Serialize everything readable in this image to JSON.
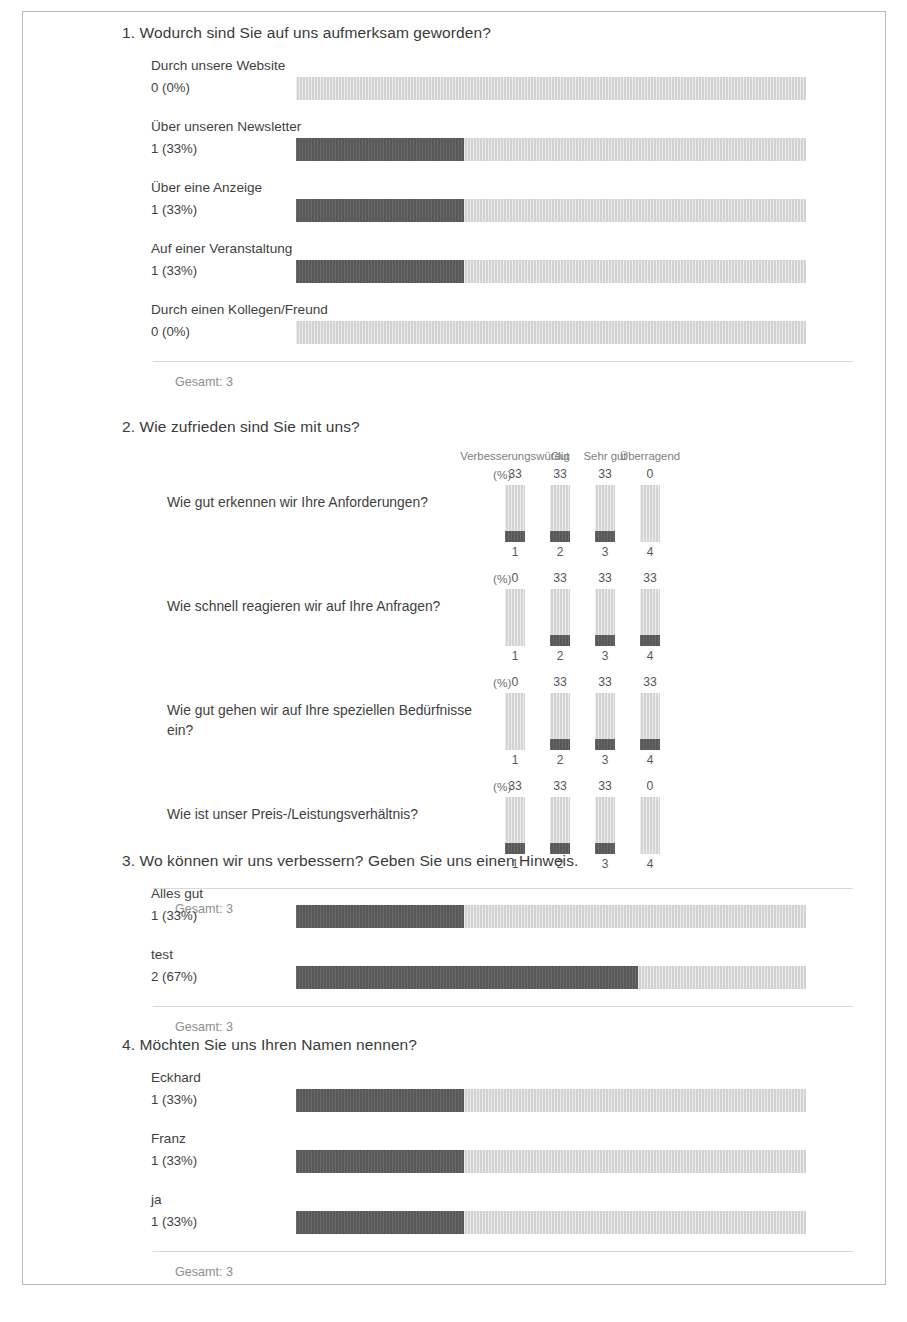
{
  "colors": {
    "bar_fill": "#585858",
    "bar_track": "#d2d2d2",
    "frame_border": "#b9b9b9",
    "text": "#3f3f3f",
    "muted_text": "#8e8e8e"
  },
  "labels": {
    "gesamt_prefix": "Gesamt:",
    "percent_axis_label": "(%)"
  },
  "questions": [
    {
      "id": "q1",
      "number": "1.",
      "title": "1. Wodurch sind Sie auf uns aufmerksam geworden?",
      "type": "bar",
      "total_label": "Gesamt: 3",
      "total": 3,
      "options": [
        {
          "label": "Durch unsere Website",
          "count": 0,
          "percent": 0,
          "value_label": "0 (0%)"
        },
        {
          "label": "Über unseren Newsletter",
          "count": 1,
          "percent": 33,
          "value_label": "1 (33%)"
        },
        {
          "label": "Über eine Anzeige",
          "count": 1,
          "percent": 33,
          "value_label": "1 (33%)"
        },
        {
          "label": "Auf einer Veranstaltung",
          "count": 1,
          "percent": 33,
          "value_label": "1 (33%)"
        },
        {
          "label": "Durch einen Kollegen/Freund",
          "count": 0,
          "percent": 0,
          "value_label": "0 (0%)"
        }
      ]
    },
    {
      "id": "q2",
      "number": "2.",
      "title": "2. Wie zufrieden sind Sie mit uns?",
      "type": "matrix",
      "total_label": "Gesamt: 3",
      "total": 3,
      "percent_axis_label": "(%)",
      "columns": [
        {
          "index": "1",
          "header": "Verbesserungswürdig"
        },
        {
          "index": "2",
          "header": "Gut"
        },
        {
          "index": "3",
          "header": "Sehr gut"
        },
        {
          "index": "4",
          "header": "Überragend"
        }
      ],
      "rows": [
        {
          "text": "Wie gut erkennen wir Ihre Anforderungen?",
          "values": [
            "33",
            "33",
            "33",
            "0"
          ],
          "percents": [
            33,
            33,
            33,
            0
          ]
        },
        {
          "text": "Wie schnell reagieren wir auf Ihre Anfragen?",
          "values": [
            "0",
            "33",
            "33",
            "33"
          ],
          "percents": [
            0,
            33,
            33,
            33
          ]
        },
        {
          "text": "Wie gut gehen wir auf Ihre speziellen Bedürfnisse ein?",
          "values": [
            "0",
            "33",
            "33",
            "33"
          ],
          "percents": [
            0,
            33,
            33,
            33
          ]
        },
        {
          "text": "Wie ist unser Preis-/Leistungsverhältnis?",
          "values": [
            "33",
            "33",
            "33",
            "0"
          ],
          "percents": [
            33,
            33,
            33,
            0
          ]
        }
      ]
    },
    {
      "id": "q3",
      "number": "3.",
      "title": "3. Wo können wir uns verbessern? Geben Sie uns einen Hinweis.",
      "type": "bar",
      "total_label": "Gesamt: 3",
      "total": 3,
      "options": [
        {
          "label": "Alles gut",
          "count": 1,
          "percent": 33,
          "value_label": "1 (33%)"
        },
        {
          "label": "test",
          "count": 2,
          "percent": 67,
          "value_label": "2 (67%)"
        }
      ]
    },
    {
      "id": "q4",
      "number": "4.",
      "title": "4. Möchten Sie uns Ihren Namen nennen?",
      "type": "bar",
      "total_label": "Gesamt: 3",
      "total": 3,
      "options": [
        {
          "label": "Eckhard",
          "count": 1,
          "percent": 33,
          "value_label": "1 (33%)"
        },
        {
          "label": "Franz",
          "count": 1,
          "percent": 33,
          "value_label": "1 (33%)"
        },
        {
          "label": "ja",
          "count": 1,
          "percent": 33,
          "value_label": "1 (33%)"
        }
      ]
    }
  ],
  "chart_data": [
    {
      "type": "bar",
      "title": "1. Wodurch sind Sie auf uns aufmerksam geworden?",
      "orientation": "horizontal",
      "categories": [
        "Durch unsere Website",
        "Über unseren Newsletter",
        "Über eine Anzeige",
        "Auf einer Veranstaltung",
        "Durch einen Kollegen/Freund"
      ],
      "values": [
        0,
        1,
        1,
        1,
        0
      ],
      "percent_values": [
        0,
        33,
        33,
        33,
        0
      ],
      "xlabel": "",
      "ylabel": "",
      "xlim": [
        0,
        100
      ],
      "total": 3,
      "grid": false,
      "legend": "none"
    },
    {
      "type": "bar",
      "title": "2. Wie zufrieden sind Sie mit uns?",
      "orientation": "vertical",
      "categories": [
        "1",
        "2",
        "3",
        "4"
      ],
      "column_headers": [
        "Verbesserungswürdig",
        "Gut",
        "Sehr gut",
        "Überragend"
      ],
      "series": [
        {
          "name": "Wie gut erkennen wir Ihre Anforderungen?",
          "values": [
            33,
            33,
            33,
            0
          ]
        },
        {
          "name": "Wie schnell reagieren wir auf Ihre Anfragen?",
          "values": [
            0,
            33,
            33,
            33
          ]
        },
        {
          "name": "Wie gut gehen wir auf Ihre speziellen Bedürfnisse ein?",
          "values": [
            0,
            33,
            33,
            33
          ]
        },
        {
          "name": "Wie ist unser Preis-/Leistungsverhältnis?",
          "values": [
            33,
            33,
            33,
            0
          ]
        }
      ],
      "xlabel": "",
      "ylabel": "(%)",
      "ylim": [
        0,
        100
      ],
      "total": 3,
      "grid": false,
      "legend": "top"
    },
    {
      "type": "bar",
      "title": "3. Wo können wir uns verbessern? Geben Sie uns einen Hinweis.",
      "orientation": "horizontal",
      "categories": [
        "Alles gut",
        "test"
      ],
      "values": [
        1,
        2
      ],
      "percent_values": [
        33,
        67
      ],
      "xlabel": "",
      "ylabel": "",
      "xlim": [
        0,
        100
      ],
      "total": 3,
      "grid": false,
      "legend": "none"
    },
    {
      "type": "bar",
      "title": "4. Möchten Sie uns Ihren Namen nennen?",
      "orientation": "horizontal",
      "categories": [
        "Eckhard",
        "Franz",
        "ja"
      ],
      "values": [
        1,
        1,
        1
      ],
      "percent_values": [
        33,
        33,
        33
      ],
      "xlabel": "",
      "ylabel": "",
      "xlim": [
        0,
        100
      ],
      "total": 3,
      "grid": false,
      "legend": "none"
    }
  ]
}
